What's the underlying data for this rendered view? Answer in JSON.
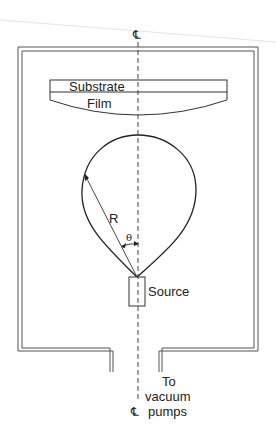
{
  "diagram": {
    "labels": {
      "centerline_top": "℄",
      "centerline_bottom": "℄",
      "substrate": "Substrate",
      "film": "Film",
      "radius": "R",
      "angle": "θ",
      "source": "Source",
      "outlet_line1": "To",
      "outlet_line2": "vacuum",
      "outlet_line3": "pumps"
    },
    "colors": {
      "stroke": "#222222",
      "chamber": "#555555",
      "artifact": "#d8d8d8"
    }
  }
}
